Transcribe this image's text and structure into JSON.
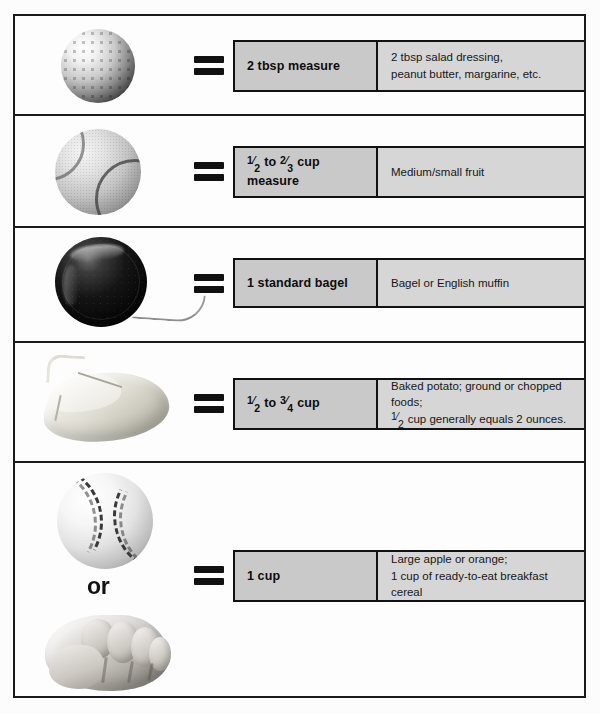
{
  "equals_symbol": "=",
  "or_label": "or",
  "rows": [
    {
      "item_icon": "golf-ball-icon",
      "item_name": "golf ball",
      "measure": "2 tbsp measure",
      "measure_parts": null,
      "description": "2 tbsp salad dressing,\npeanut butter, margarine, etc.",
      "description_lines": [
        "2 tbsp salad dressing,",
        "peanut butter, margarine, etc."
      ]
    },
    {
      "item_icon": "tennis-ball-icon",
      "item_name": "tennis ball",
      "measure": "1/2 to 2/3 cup measure",
      "measure_parts": {
        "frac1_num": "1",
        "frac1_den": "2",
        "mid": " to ",
        "frac2_num": "2",
        "frac2_den": "3",
        "tail": " cup",
        "line2": "measure"
      },
      "description": "Medium/small fruit",
      "description_lines": [
        "Medium/small fruit"
      ]
    },
    {
      "item_icon": "yo-yo-icon",
      "item_name": "yo-yo",
      "measure": "1 standard bagel",
      "measure_parts": null,
      "description": "Bagel or English muffin",
      "description_lines": [
        "Bagel or English muffin"
      ]
    },
    {
      "item_icon": "computer-mouse-icon",
      "item_name": "computer mouse",
      "measure": "1/2 to 3/4 cup",
      "measure_parts": {
        "frac1_num": "1",
        "frac1_den": "2",
        "mid": " to ",
        "frac2_num": "3",
        "frac2_den": "4",
        "tail": " cup",
        "line2": ""
      },
      "description": "Baked potato; ground or chopped foods; 1/2 cup generally equals 2 ounces.",
      "description_lines": [
        "Baked potato; ground or chopped foods;",
        "cup generally equals 2 ounces."
      ],
      "description_line2_frac": {
        "num": "1",
        "den": "2"
      }
    },
    {
      "item_icon": "baseball-and-fist-icon",
      "item_name": "baseball or fist",
      "measure": "1 cup",
      "measure_parts": null,
      "description": "Large apple or orange; 1 cup of ready-to-eat breakfast cereal",
      "description_lines": [
        "Large apple or orange;",
        "1 cup of ready-to-eat breakfast cereal"
      ]
    }
  ],
  "colors": {
    "measure_box": "#c9c9c9",
    "description_box": "#d6d6d6",
    "border": "#111111",
    "page_background": "#fcfcfc"
  }
}
